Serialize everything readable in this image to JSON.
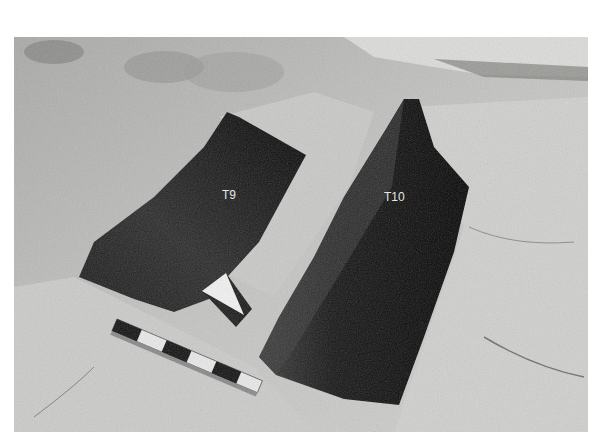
{
  "photo": {
    "description": "Black-and-white photograph of two rock-cut tomb shafts with a scale bar and north arrow",
    "labels": {
      "t9": "T9",
      "t10": "T10"
    },
    "colors": {
      "rock_light": "#d6d6d4",
      "rock_mid": "#b9b9b7",
      "rock_dark": "#8e8e8c",
      "shaft": "#0c0c0c",
      "label_text": "#e8e8e8"
    }
  }
}
